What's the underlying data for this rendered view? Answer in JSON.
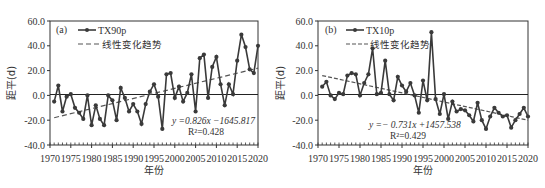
{
  "chart_data": [
    {
      "id": "a",
      "type": "line",
      "panel_label": "(a)",
      "title": "",
      "xlabel": "年份",
      "ylabel": "距平(d)",
      "xlim": [
        1970,
        2020
      ],
      "ylim": [
        -40,
        60
      ],
      "x_ticks": [
        "1970",
        "1975",
        "1980",
        "1985",
        "1990",
        "1995",
        "2000",
        "2005",
        "2010",
        "2015",
        "2020"
      ],
      "y_ticks": [
        "60.0",
        "40.0",
        "20.0",
        "0.0",
        "-20.0",
        "-40.0"
      ],
      "grid": false,
      "legend_position": "upper-left",
      "x": [
        1971,
        1972,
        1973,
        1974,
        1975,
        1976,
        1977,
        1978,
        1979,
        1980,
        1981,
        1982,
        1983,
        1984,
        1985,
        1986,
        1987,
        1988,
        1989,
        1990,
        1991,
        1992,
        1993,
        1994,
        1995,
        1996,
        1997,
        1998,
        1999,
        2000,
        2001,
        2002,
        2003,
        2004,
        2005,
        2006,
        2007,
        2008,
        2009,
        2010,
        2011,
        2012,
        2013,
        2014,
        2015,
        2016,
        2017,
        2018,
        2019,
        2020
      ],
      "series": [
        {
          "name": "TX90p",
          "style": "solid-with-markers",
          "values": [
            -5,
            8,
            -13,
            -1,
            1,
            -10,
            -14,
            -19,
            0,
            -24,
            -8,
            -19,
            -24,
            0,
            -4,
            -20,
            6,
            -2,
            -13,
            -7,
            -13,
            -23,
            -7,
            3,
            9,
            -1,
            -27,
            17,
            18,
            -2,
            7,
            -5,
            2,
            17,
            -13,
            30,
            33,
            -2,
            23,
            31,
            9,
            -8,
            9,
            1,
            28,
            49,
            39,
            21,
            18,
            40
          ]
        },
        {
          "name": "线性变化趋势",
          "style": "dashed",
          "values_at": {
            "1971": -18,
            "2020": 22
          }
        }
      ],
      "annotations": [
        "y =0.826x −1645.817",
        "R²=0.428"
      ]
    },
    {
      "id": "b",
      "type": "line",
      "panel_label": "(b)",
      "title": "",
      "xlabel": "年份",
      "ylabel": "距平(d)",
      "xlim": [
        1970,
        2020
      ],
      "ylim": [
        -40,
        60
      ],
      "x_ticks": [
        "1970",
        "1975",
        "1980",
        "1985",
        "1990",
        "1995",
        "2000",
        "2005",
        "2010",
        "2015",
        "2020"
      ],
      "y_ticks": [
        "60.0",
        "40.0",
        "20.0",
        "0.0",
        "-20.0",
        "-40.0"
      ],
      "grid": false,
      "legend_position": "upper-left",
      "x": [
        1971,
        1972,
        1973,
        1974,
        1975,
        1976,
        1977,
        1978,
        1979,
        1980,
        1981,
        1982,
        1983,
        1984,
        1985,
        1986,
        1987,
        1988,
        1989,
        1990,
        1991,
        1992,
        1993,
        1994,
        1995,
        1996,
        1997,
        1998,
        1999,
        2000,
        2001,
        2002,
        2003,
        2004,
        2005,
        2006,
        2007,
        2008,
        2009,
        2010,
        2011,
        2012,
        2013,
        2014,
        2015,
        2016,
        2017,
        2018,
        2019,
        2020
      ],
      "series": [
        {
          "name": "TX10p",
          "style": "solid-with-markers",
          "values": [
            7,
            11,
            0,
            -3,
            2,
            1,
            16,
            18,
            17,
            0,
            10,
            17,
            38,
            1,
            2,
            28,
            1,
            -4,
            15,
            8,
            3,
            10,
            0,
            -14,
            12,
            -4,
            51,
            -3,
            -15,
            1,
            -19,
            -5,
            -13,
            -11,
            -12,
            -16,
            -21,
            -6,
            -20,
            -27,
            -17,
            -10,
            -14,
            -17,
            -16,
            -26,
            -20,
            -15,
            -10,
            -17
          ]
        },
        {
          "name": "线性变化趋势",
          "style": "dashed",
          "values_at": {
            "1971": 16,
            "2020": -20
          }
        }
      ],
      "annotations": [
        "y =− 0.731x +1457.538",
        "R²=0.429"
      ]
    }
  ],
  "panels": {
    "a": {
      "label": "(a)",
      "legend_series": "TX90p",
      "legend_trend": "线性变化趋势",
      "equation": "y =0.826x −1645.817",
      "r2": "R²=0.428",
      "xlabel": "年份",
      "ylabel": "距平(d)"
    },
    "b": {
      "label": "(b)",
      "legend_series": "TX10p",
      "legend_trend": "线性变化趋势",
      "equation": "y =− 0.731x +1457.538",
      "r2": "R²=0.429",
      "xlabel": "年份",
      "ylabel": "距平(d)"
    }
  },
  "colors": {
    "line": "#3a3a3a",
    "marker": "#3a3a3a",
    "axis": "#333333",
    "zero_line": "#222222"
  }
}
